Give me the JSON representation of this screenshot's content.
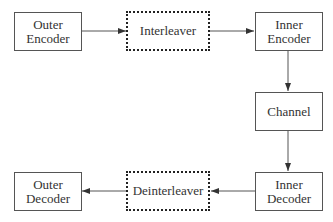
{
  "diagram": {
    "type": "block-diagram",
    "blocks": [
      {
        "id": "outer_encoder",
        "label": "Outer\nEncoder",
        "style": "solid"
      },
      {
        "id": "interleaver",
        "label": "Interleaver",
        "style": "dotted"
      },
      {
        "id": "inner_encoder",
        "label": "Inner\nEncoder",
        "style": "solid"
      },
      {
        "id": "channel",
        "label": "Channel",
        "style": "solid"
      },
      {
        "id": "inner_decoder",
        "label": "Inner\nDecoder",
        "style": "solid"
      },
      {
        "id": "deinterleaver",
        "label": "Deinterleaver",
        "style": "dotted"
      },
      {
        "id": "outer_decoder",
        "label": "Outer\nDecoder",
        "style": "solid"
      }
    ],
    "edges": [
      {
        "from": "outer_encoder",
        "to": "interleaver"
      },
      {
        "from": "interleaver",
        "to": "inner_encoder"
      },
      {
        "from": "inner_encoder",
        "to": "channel"
      },
      {
        "from": "channel",
        "to": "inner_decoder"
      },
      {
        "from": "inner_decoder",
        "to": "deinterleaver"
      },
      {
        "from": "deinterleaver",
        "to": "outer_decoder"
      }
    ]
  }
}
